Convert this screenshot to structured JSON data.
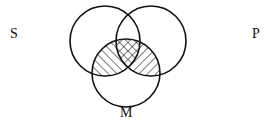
{
  "diagram": {
    "type": "venn-3",
    "labels": {
      "s": "S",
      "p": "P",
      "m": "M"
    },
    "circles": [
      {
        "id": "S",
        "cx": 105,
        "cy": 41,
        "r": 35
      },
      {
        "id": "P",
        "cx": 151,
        "cy": 41,
        "r": 35
      },
      {
        "id": "M",
        "cx": 126,
        "cy": 73,
        "r": 34
      }
    ],
    "shaded_regions": [
      {
        "region": "S∩M only",
        "pattern": "diagonal-hatch-down-right"
      },
      {
        "region": "P∩M only",
        "pattern": "diagonal-hatch-up-right"
      },
      {
        "region": "S∩P∩M",
        "pattern": "cross-hatch"
      }
    ],
    "stroke_color": "#111111"
  }
}
